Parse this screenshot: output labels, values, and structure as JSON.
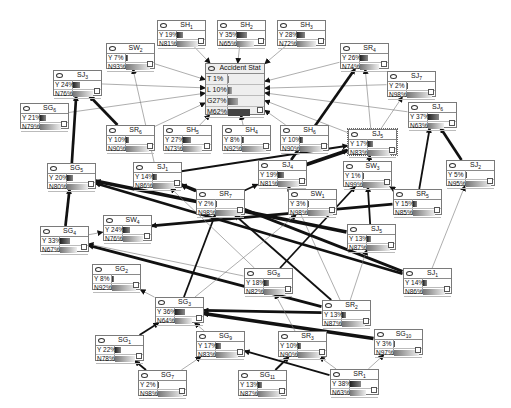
{
  "diagram": {
    "type": "bayesian-network",
    "target": {
      "id": "accident",
      "title": "Accident Stat",
      "states": [
        {
          "label": "T",
          "value": "1%",
          "pct": 1
        },
        {
          "label": "L",
          "value": "10%",
          "pct": 10
        },
        {
          "label": "G",
          "value": "27%",
          "pct": 27
        },
        {
          "label": "M",
          "value": "62%",
          "pct": 62
        }
      ]
    },
    "nodes": [
      {
        "id": "SH1",
        "name": "SH",
        "sub": "1",
        "y": "Y 19%",
        "n": "N81%",
        "yp": 19,
        "x": 157,
        "top": 20
      },
      {
        "id": "SH2",
        "name": "SH",
        "sub": "2",
        "y": "Y 35%",
        "n": "N65%",
        "yp": 35,
        "x": 217,
        "top": 20
      },
      {
        "id": "SH3",
        "name": "SH",
        "sub": "3",
        "y": "Y 28%",
        "n": "N72%",
        "yp": 28,
        "x": 277,
        "top": 20
      },
      {
        "id": "SW2",
        "name": "SW",
        "sub": "2",
        "y": "Y  7%",
        "n": "N93%",
        "yp": 7,
        "x": 106,
        "top": 43
      },
      {
        "id": "SR4",
        "name": "SR",
        "sub": "4",
        "y": "Y 26%",
        "n": "N74%",
        "yp": 26,
        "x": 340,
        "top": 43
      },
      {
        "id": "SJ3",
        "name": "SJ",
        "sub": "3",
        "y": "Y 24%",
        "n": "N76%",
        "yp": 24,
        "x": 53,
        "top": 70
      },
      {
        "id": "SJ7",
        "name": "SJ",
        "sub": "7",
        "y": "Y  2%",
        "n": "N98%",
        "yp": 2,
        "x": 387,
        "top": 71
      },
      {
        "id": "SG6",
        "name": "SG",
        "sub": "6",
        "y": "Y 21%",
        "n": "N79%",
        "yp": 21,
        "x": 20,
        "top": 103
      },
      {
        "id": "SJ6",
        "name": "SJ",
        "sub": "6",
        "y": "Y 37%",
        "n": "N63%",
        "yp": 37,
        "x": 408,
        "top": 102
      },
      {
        "id": "SR6",
        "name": "SR",
        "sub": "6",
        "y": "Y 10%",
        "n": "N90%",
        "yp": 10,
        "x": 106,
        "top": 125
      },
      {
        "id": "SH5",
        "name": "SH",
        "sub": "5",
        "y": "Y 27%",
        "n": "N73%",
        "yp": 27,
        "x": 163,
        "top": 125
      },
      {
        "id": "SH4",
        "name": "SH",
        "sub": "4",
        "y": "Y  8%",
        "n": "N92%",
        "yp": 8,
        "x": 222,
        "top": 125
      },
      {
        "id": "SH6",
        "name": "SH",
        "sub": "6",
        "y": "Y 10%",
        "n": "N90%",
        "yp": 10,
        "x": 280,
        "top": 125
      },
      {
        "id": "SJ5",
        "name": "SJ",
        "sub": "5",
        "y": "Y 17%",
        "n": "N83%",
        "yp": 17,
        "x": 348,
        "top": 129,
        "sel": true
      },
      {
        "id": "SG5",
        "name": "SG",
        "sub": "5",
        "y": "Y 20%",
        "n": "N80%",
        "yp": 20,
        "x": 47,
        "top": 163
      },
      {
        "id": "SJ1",
        "name": "SJ",
        "sub": "1",
        "y": "Y 14%",
        "n": "N86%",
        "yp": 14,
        "x": 133,
        "top": 162
      },
      {
        "id": "SJ4",
        "name": "SJ",
        "sub": "4",
        "y": "Y 19%",
        "n": "N81%",
        "yp": 19,
        "x": 258,
        "top": 160
      },
      {
        "id": "SW3",
        "name": "SW",
        "sub": "3",
        "y": "Y  1%",
        "n": "N99%",
        "yp": 1,
        "x": 343,
        "top": 161
      },
      {
        "id": "SJ2",
        "name": "SJ",
        "sub": "2",
        "y": "Y  5%",
        "n": "N95%",
        "yp": 5,
        "x": 446,
        "top": 160
      },
      {
        "id": "SR7",
        "name": "SR",
        "sub": "7",
        "y": "Y  2%",
        "n": "N98%",
        "yp": 2,
        "x": 196,
        "top": 189
      },
      {
        "id": "SW1",
        "name": "SW",
        "sub": "1",
        "y": "Y  3%",
        "n": "N98%",
        "yp": 3,
        "x": 288,
        "top": 189
      },
      {
        "id": "SR5",
        "name": "SR",
        "sub": "5",
        "y": "Y 15%",
        "n": "N85%",
        "yp": 15,
        "x": 393,
        "top": 189
      },
      {
        "id": "SW4",
        "name": "SW",
        "sub": "4",
        "y": "Y 24%",
        "n": "N76%",
        "yp": 24,
        "x": 103,
        "top": 215
      },
      {
        "id": "SG4",
        "name": "SG",
        "sub": "4",
        "y": "Y 33%",
        "n": "N67%",
        "yp": 33,
        "x": 40,
        "top": 226
      },
      {
        "id": "SJ5b",
        "name": "SJ",
        "sub": "5",
        "y": "Y 13%",
        "n": "N87%",
        "yp": 13,
        "x": 347,
        "top": 224
      },
      {
        "id": "SG2",
        "name": "SG",
        "sub": "2",
        "y": "Y  8%",
        "n": "N92%",
        "yp": 8,
        "x": 92,
        "top": 264
      },
      {
        "id": "SG8",
        "name": "SG",
        "sub": "8",
        "y": "Y 18%",
        "n": "N82%",
        "yp": 18,
        "x": 244,
        "top": 268
      },
      {
        "id": "SJ1b",
        "name": "SJ",
        "sub": "1",
        "y": "Y 14%",
        "n": "N86%",
        "yp": 14,
        "x": 403,
        "top": 268
      },
      {
        "id": "SG3",
        "name": "SG",
        "sub": "3",
        "y": "Y 36%",
        "n": "N64%",
        "yp": 36,
        "x": 155,
        "top": 297
      },
      {
        "id": "SR2",
        "name": "SR",
        "sub": "2",
        "y": "Y 13%",
        "n": "N87%",
        "yp": 13,
        "x": 322,
        "top": 300
      },
      {
        "id": "SG1",
        "name": "SG",
        "sub": "1",
        "y": "Y 22%",
        "n": "N78%",
        "yp": 22,
        "x": 95,
        "top": 335
      },
      {
        "id": "SG9",
        "name": "SG",
        "sub": "9",
        "y": "Y 17%",
        "n": "N83%",
        "yp": 17,
        "x": 196,
        "top": 331
      },
      {
        "id": "SR3",
        "name": "SR",
        "sub": "3",
        "y": "Y 10%",
        "n": "N90%",
        "yp": 10,
        "x": 278,
        "top": 331
      },
      {
        "id": "SG10",
        "name": "SG",
        "sub": "10",
        "y": "Y  3%",
        "n": "N97%",
        "yp": 3,
        "x": 374,
        "top": 329
      },
      {
        "id": "SG7",
        "name": "SG",
        "sub": "7",
        "y": "Y  2%",
        "n": "N98%",
        "yp": 2,
        "x": 138,
        "top": 370
      },
      {
        "id": "SG11",
        "name": "SG",
        "sub": "11",
        "y": "Y 13%",
        "n": "N87%",
        "yp": 13,
        "x": 238,
        "top": 370
      },
      {
        "id": "SR1",
        "name": "SR",
        "sub": "1",
        "y": "Y 38%",
        "n": "N63%",
        "yp": 38,
        "x": 330,
        "top": 369
      }
    ],
    "edges": [
      [
        "SH1",
        "accident",
        1
      ],
      [
        "SH2",
        "accident",
        1
      ],
      [
        "SH3",
        "accident",
        1
      ],
      [
        "SW2",
        "accident",
        1
      ],
      [
        "SR4",
        "accident",
        1
      ],
      [
        "SJ3",
        "accident",
        1
      ],
      [
        "SJ7",
        "accident",
        1
      ],
      [
        "SG6",
        "accident",
        1
      ],
      [
        "SJ6",
        "accident",
        1
      ],
      [
        "SR6",
        "accident",
        1
      ],
      [
        "SH5",
        "accident",
        1
      ],
      [
        "SH4",
        "accident",
        1
      ],
      [
        "SH6",
        "accident",
        1
      ],
      [
        "SJ5",
        "accident",
        1
      ],
      [
        "SJ4",
        "SR4",
        3
      ],
      [
        "SJ5",
        "SR4",
        1
      ],
      [
        "SJ5",
        "SJ7",
        1
      ],
      [
        "SJ4",
        "SJ5",
        4
      ],
      [
        "SJ1",
        "SJ5",
        2
      ],
      [
        "SW3",
        "SJ5",
        2
      ],
      [
        "SR5",
        "SJ6",
        2
      ],
      [
        "SJ2",
        "SJ6",
        3
      ],
      [
        "SG5",
        "SJ3",
        3
      ],
      [
        "SR6",
        "SJ3",
        3
      ],
      [
        "SG4",
        "SG5",
        3
      ],
      [
        "SG4",
        "SW4",
        1
      ],
      [
        "SJ1",
        "SW2",
        1
      ],
      [
        "SR7",
        "SJ4",
        2
      ],
      [
        "SR5",
        "SW3",
        2
      ],
      [
        "SJ5b",
        "SW3",
        2
      ],
      [
        "SG8",
        "SW3",
        2
      ],
      [
        "SR2",
        "SJ4",
        1
      ],
      [
        "SR7",
        "SJ1",
        2
      ],
      [
        "SJ5b",
        "SG5",
        4
      ],
      [
        "SJ1b",
        "SG5",
        3
      ],
      [
        "SR5",
        "SW4",
        3
      ],
      [
        "SJ1b",
        "SJ1",
        3
      ],
      [
        "SR2",
        "SG4",
        3
      ],
      [
        "SG8",
        "SG4",
        1
      ],
      [
        "SG3",
        "SG2",
        1
      ],
      [
        "SG1",
        "SG3",
        2
      ],
      [
        "SG9",
        "SG3",
        1
      ],
      [
        "SG7",
        "SG1",
        2
      ],
      [
        "SG7",
        "SG9",
        1
      ],
      [
        "SG10",
        "SG3",
        4
      ],
      [
        "SR2",
        "SG3",
        3
      ],
      [
        "SR1",
        "SG9",
        2
      ],
      [
        "SR1",
        "SR3",
        1
      ],
      [
        "SR1",
        "SG10",
        1
      ],
      [
        "SG11",
        "SR3",
        2
      ],
      [
        "SR3",
        "SG8",
        1
      ],
      [
        "SG3",
        "SR7",
        2
      ],
      [
        "SG8",
        "SJ1",
        1
      ],
      [
        "SR2",
        "SR7",
        2
      ],
      [
        "SJ1b",
        "SJ2",
        1
      ],
      [
        "SG3",
        "SW1",
        1
      ],
      [
        "SR2",
        "SJ5b",
        1
      ]
    ]
  }
}
